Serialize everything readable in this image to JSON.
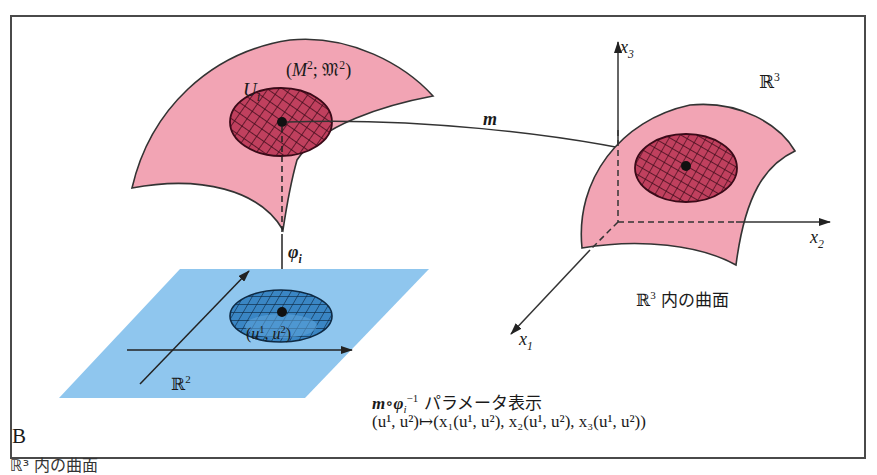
{
  "figure": {
    "panel_letter": "B",
    "caption_below": "ℝ³ 内の曲面"
  },
  "manifold": {
    "label": "(M²; 𝔐²)",
    "label_parts": {
      "open": "(",
      "M": "M",
      "M_sup": "2",
      "sep": "; ",
      "atlas": "𝔐",
      "atlas_sup": "2",
      "close": ")"
    },
    "chart_domain": {
      "base": "U",
      "sub": "i"
    },
    "fill_color": "#f2a4b4",
    "patch_color": "#c0405e"
  },
  "maps": {
    "embedding": "m",
    "chart": {
      "base": "φ",
      "sub": "i"
    }
  },
  "plane": {
    "label": {
      "base": "ℝ",
      "sup": "2"
    },
    "point": {
      "open": "(",
      "u1": "u",
      "s1": "1",
      "comma": ", ",
      "u2": "u",
      "s2": "2",
      "close": ")"
    },
    "fill_color": "#8fc6ee",
    "patch_color": "#3a86c4"
  },
  "space": {
    "label": {
      "base": "ℝ",
      "sup": "3"
    },
    "axes": [
      {
        "base": "x",
        "sub": "1"
      },
      {
        "base": "x",
        "sub": "2"
      },
      {
        "base": "x",
        "sub": "3"
      }
    ],
    "surface_caption": {
      "base": "ℝ",
      "sup": "3",
      "text": " 内の曲面"
    }
  },
  "parametrization": {
    "map": {
      "m": "m",
      "circ": "∘",
      "phi": "φ",
      "sub": "i",
      "sup": "−1"
    },
    "title": " パラメータ表示",
    "formula": "(u¹, u²)↦(x₁(u¹, u²), x₂(u¹, u²), x₃(u¹, u²))"
  }
}
